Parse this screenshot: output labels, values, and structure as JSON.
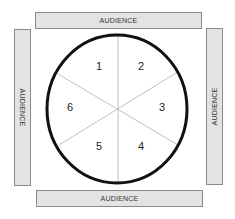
{
  "diagram": {
    "type": "seating-arrangement",
    "audience_labels": {
      "top": "AUDIENCE",
      "bottom": "AUDIENCE",
      "left": "AUDIENCE",
      "right": "AUDIENCE"
    },
    "circle": {
      "segments": [
        {
          "label": "1"
        },
        {
          "label": "2"
        },
        {
          "label": "3"
        },
        {
          "label": "4"
        },
        {
          "label": "5"
        },
        {
          "label": "6"
        }
      ]
    },
    "colors": {
      "bar_fill": "#e3e3e3",
      "bar_border": "#8a8a8a",
      "circle_stroke": "#111111",
      "divider": "#b0b0b0",
      "text": "#222222"
    }
  }
}
